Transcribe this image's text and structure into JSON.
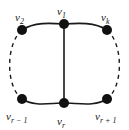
{
  "figure": {
    "kind": "graph-diagram",
    "background_color": "#ffffff",
    "stroke_color": "#1a1a1a",
    "node_color": "#111111",
    "node_radius_px": 5,
    "solid_line_width_px": 1.6,
    "dashed_line_width_px": 1.4,
    "dash_pattern": "4,4"
  },
  "nodes": [
    {
      "id": "v1",
      "label": "v",
      "sub": "1",
      "label_text": "v₁",
      "x": 64,
      "y": 24,
      "position": "top-center"
    },
    {
      "id": "v2",
      "label": "v",
      "sub": "2",
      "label_text": "v₂",
      "x": 22,
      "y": 30,
      "position": "top-left"
    },
    {
      "id": "vk",
      "label": "v",
      "sub": "k",
      "label_text": "v_k",
      "x": 107,
      "y": 30,
      "position": "top-right"
    },
    {
      "id": "vrm1",
      "label": "v",
      "sub": "r − 1",
      "label_text": "v_{r-1}",
      "x": 22,
      "y": 99,
      "position": "bottom-left"
    },
    {
      "id": "vr",
      "label": "v",
      "sub": "r",
      "label_text": "v_r",
      "x": 64,
      "y": 103,
      "position": "bottom-center"
    },
    {
      "id": "vrp1",
      "label": "v",
      "sub": "r + 1",
      "label_text": "v_{r+1}",
      "x": 107,
      "y": 99,
      "position": "bottom-right"
    }
  ],
  "edges": [
    {
      "from": "v2",
      "to": "v1",
      "style": "solid",
      "shape": "curve",
      "name": "edge-v2-v1"
    },
    {
      "from": "v1",
      "to": "vk",
      "style": "solid",
      "shape": "curve",
      "name": "edge-v1-vk"
    },
    {
      "from": "vrm1",
      "to": "vr",
      "style": "solid",
      "shape": "curve",
      "name": "edge-vrm1-vr"
    },
    {
      "from": "vr",
      "to": "vrp1",
      "style": "solid",
      "shape": "curve",
      "name": "edge-vr-vrp1"
    },
    {
      "from": "v1",
      "to": "vr",
      "style": "solid",
      "shape": "straight",
      "name": "edge-v1-vr-chord"
    },
    {
      "from": "v2",
      "to": "vrm1",
      "style": "dashed",
      "shape": "arc",
      "name": "edge-v2-vrm1-dashed"
    },
    {
      "from": "vk",
      "to": "vrp1",
      "style": "dashed",
      "shape": "arc",
      "name": "edge-vk-vrp1-dashed"
    }
  ],
  "labels": {
    "v1": "v",
    "v1_sub": "1",
    "v2": "v",
    "v2_sub": "2",
    "vk": "v",
    "vk_sub": "k",
    "vrm1": "v",
    "vrm1_sub": "r − 1",
    "vr": "v",
    "vr_sub": "r",
    "vrp1": "v",
    "vrp1_sub": "r + 1"
  }
}
